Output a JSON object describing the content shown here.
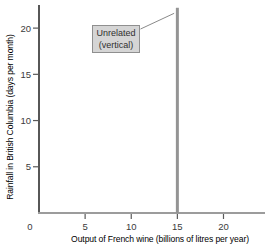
{
  "chart_data": {
    "type": "line",
    "title": "",
    "xlabel": "Output of French wine (billions of litres per year)",
    "ylabel": "Rainfall in British Columbia (days per month)",
    "xlim": [
      0,
      24.5
    ],
    "ylim": [
      0,
      22.5
    ],
    "x_ticks": [
      5,
      10,
      15,
      20
    ],
    "y_ticks": [
      5,
      10,
      15,
      20
    ],
    "origin_label": "0",
    "grid": false,
    "legend": "none",
    "series": [
      {
        "name": "Unrelated (vertical)",
        "shape": "vertical-line",
        "x": 15,
        "points": [
          {
            "x": 15,
            "y": 0
          },
          {
            "x": 15,
            "y": 22.2
          }
        ],
        "color": "#949494",
        "width": 3
      }
    ],
    "annotation": {
      "lines": [
        "Unrelated",
        "(vertical)"
      ],
      "box_fill": "#d5d5d5",
      "box_border": "#8f8f8f",
      "text_color": "#2f2f2f",
      "leader_from": {
        "x": 11.0,
        "y": 19.9
      },
      "leader_to": {
        "x": 14.65,
        "y": 21.6
      }
    },
    "style": {
      "background": "#ffffff",
      "y_axis_color": "#2d2d2d",
      "x_axis_color": "#9c9c9c",
      "tick_color": "#5a5a5a",
      "label_color": "#3b3b3b",
      "leader_color": "#8a8a8a"
    }
  }
}
